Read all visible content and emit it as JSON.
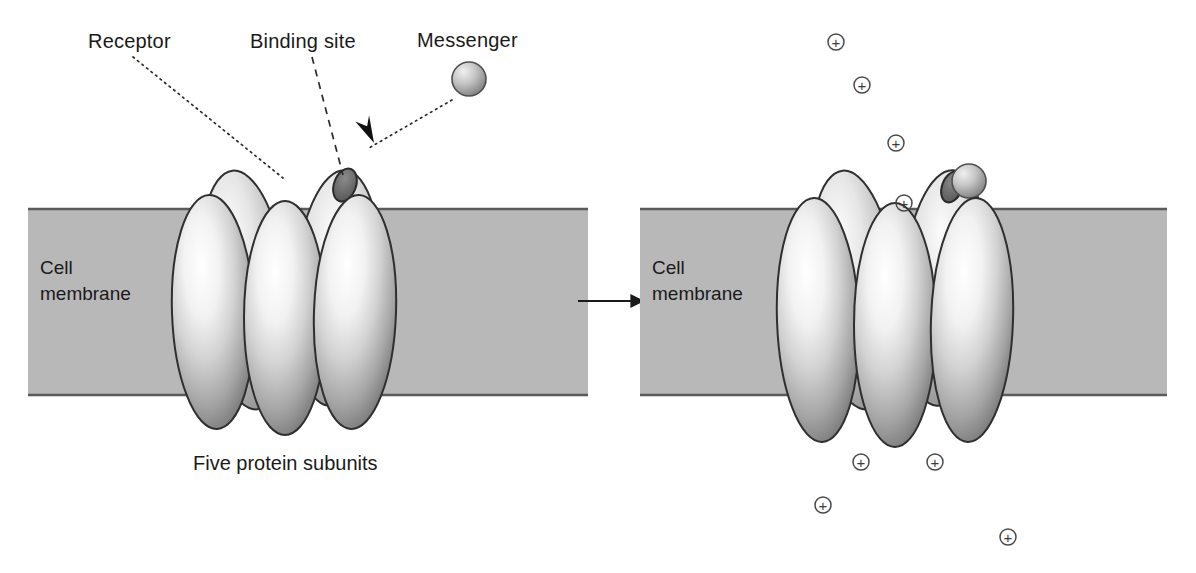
{
  "figure": {
    "width": 1196,
    "height": 573,
    "background": "#ffffff",
    "type": "biology-diagram"
  },
  "colors": {
    "membrane_fill": "#b8b8b8",
    "membrane_edge": "#5a5a5a",
    "subunit_light": "#ffffff",
    "subunit_mid": "#c9c9c9",
    "subunit_dark": "#6e6e6e",
    "subunit_outline": "#2f2f2f",
    "binding_site": "#6b6b6b",
    "binding_site_outline": "#2a2a2a",
    "messenger_light": "#e8e8e8",
    "messenger_dark": "#8a8a8a",
    "ion_stroke": "#4a4a4a",
    "text": "#1a1a1a",
    "leader_line": "#2a2a2a"
  },
  "labels": {
    "receptor": "Receptor",
    "binding_site": "Binding site",
    "messenger": "Messenger",
    "caption": "Five protein subunits",
    "cell_membrane_line1": "Cell",
    "cell_membrane_line2": "membrane",
    "ion_symbol": "+"
  },
  "left_panel": {
    "state": "closed",
    "membrane": {
      "x": 28,
      "y": 209,
      "width": 560,
      "height": 186
    },
    "membrane_label": {
      "x": 40,
      "y": 274
    },
    "caption": {
      "x": 193,
      "y": 470
    },
    "subunit_count": 5,
    "back_subunits": [
      {
        "cx": 245,
        "cy": 290,
        "rx": 43,
        "ry": 120,
        "rotate": -6
      },
      {
        "cx": 337,
        "cy": 288,
        "rx": 43,
        "ry": 118,
        "rotate": 4
      }
    ],
    "front_subunits": [
      {
        "cx": 213,
        "cy": 312,
        "rx": 41,
        "ry": 117,
        "rotate": -2
      },
      {
        "cx": 285,
        "cy": 318,
        "rx": 41,
        "ry": 117,
        "rotate": 0
      },
      {
        "cx": 355,
        "cy": 312,
        "rx": 41,
        "ry": 117,
        "rotate": 2
      }
    ],
    "binding_site": {
      "cx": 345,
      "cy": 185,
      "rx": 11,
      "ry": 17,
      "rotate": 20
    },
    "leaders": {
      "receptor": {
        "x1": 133,
        "y1": 57,
        "x2": 283,
        "y2": 178,
        "style": "dotted"
      },
      "binding_site": {
        "x1": 312,
        "y1": 57,
        "x2": 343,
        "y2": 175,
        "style": "dashed"
      },
      "messenger": {
        "x1": 452,
        "y1": 100,
        "x2": 369,
        "y2": 148,
        "style": "dotted"
      }
    },
    "label_positions": {
      "receptor": {
        "x": 88,
        "y": 48
      },
      "binding_site": {
        "x": 250,
        "y": 48
      },
      "messenger": {
        "x": 417,
        "y": 47
      }
    },
    "messenger_sphere": {
      "cx": 469,
      "cy": 79,
      "r": 17
    },
    "arrowhead": {
      "x": 374,
      "y": 143,
      "rotate": 212
    }
  },
  "transition_arrow": {
    "x1": 578,
    "y1": 301,
    "x2": 643,
    "y2": 301
  },
  "right_panel": {
    "state": "open",
    "membrane": {
      "x": 640,
      "y": 209,
      "width": 527,
      "height": 186
    },
    "membrane_label": {
      "x": 652,
      "y": 274
    },
    "back_subunits": [
      {
        "cx": 855,
        "cy": 290,
        "rx": 43,
        "ry": 120,
        "rotate": -6
      },
      {
        "cx": 945,
        "cy": 288,
        "rx": 43,
        "ry": 118,
        "rotate": 4
      }
    ],
    "front_subunits": [
      {
        "cx": 818,
        "cy": 320,
        "rx": 41,
        "ry": 122,
        "rotate": -2
      },
      {
        "cx": 895,
        "cy": 325,
        "rx": 41,
        "ry": 122,
        "rotate": 0
      },
      {
        "cx": 972,
        "cy": 320,
        "rx": 41,
        "ry": 122,
        "rotate": 2
      }
    ],
    "binding_site": {
      "cx": 952,
      "cy": 187,
      "rx": 10,
      "ry": 16,
      "rotate": 20
    },
    "messenger_sphere": {
      "cx": 969,
      "cy": 181,
      "r": 17
    },
    "ions_above": [
      {
        "cx": 836,
        "cy": 42
      },
      {
        "cx": 862,
        "cy": 85
      },
      {
        "cx": 896,
        "cy": 143
      },
      {
        "cx": 904,
        "cy": 203
      }
    ],
    "ions_below": [
      {
        "cx": 861,
        "cy": 462
      },
      {
        "cx": 935,
        "cy": 462
      },
      {
        "cx": 823,
        "cy": 505
      },
      {
        "cx": 1008,
        "cy": 537
      }
    ],
    "ion_radius": 8
  }
}
